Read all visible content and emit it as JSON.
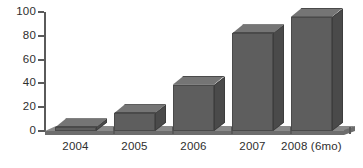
{
  "chart_data": {
    "type": "bar",
    "title": "",
    "subtitle": "",
    "xlabel": "",
    "ylabel": "",
    "categories": [
      "2004",
      "2005",
      "2006",
      "2007",
      "2008 (6mo)"
    ],
    "values": [
      3,
      15,
      39,
      82,
      96
    ],
    "series": [
      {
        "name": "",
        "values": [
          3,
          15,
          39,
          82,
          96
        ]
      }
    ],
    "ylim": [
      0,
      100
    ],
    "y_ticks": [
      0,
      20,
      40,
      60,
      80,
      100
    ],
    "y_tick_labels": [
      "0",
      "20",
      "40",
      "60",
      "80",
      "100"
    ],
    "grid": false,
    "legend": false,
    "legend_position": "none",
    "style": "3d-bar",
    "colors": {
      "bar_front": "#5e5e5e",
      "bar_top": "#757575",
      "bar_side": "#4a4a4a",
      "axis": "#5a5a5a",
      "text": "#2e2e2e",
      "background": "#ffffff",
      "floor_top": "#8a8a8a",
      "floor_front": "#6d6d6d"
    }
  }
}
